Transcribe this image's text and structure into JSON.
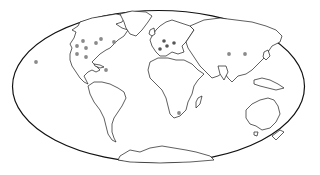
{
  "map": {
    "projection": "mollweide",
    "frame": {
      "cx": 158.5,
      "cy": 86.5,
      "rx": 146,
      "ry": 76
    },
    "marker_color": "#8a8a8a",
    "marker_dark_color": "#555555",
    "markers": [
      {
        "region": "north-america",
        "x": 83,
        "y": 41
      },
      {
        "region": "north-america",
        "x": 101,
        "y": 39
      },
      {
        "region": "north-america",
        "x": 77,
        "y": 46
      },
      {
        "region": "north-america",
        "x": 86,
        "y": 48
      },
      {
        "region": "north-america",
        "x": 96,
        "y": 43
      },
      {
        "region": "north-america",
        "x": 77,
        "y": 54
      },
      {
        "region": "north-america",
        "x": 86,
        "y": 57
      },
      {
        "region": "north-america",
        "x": 106,
        "y": 70
      },
      {
        "region": "north-america",
        "x": 114,
        "y": 42
      },
      {
        "region": "pacific-hawaii",
        "x": 36,
        "y": 62
      },
      {
        "region": "europe",
        "x": 164,
        "y": 41
      },
      {
        "region": "europe",
        "x": 167,
        "y": 46
      },
      {
        "region": "europe",
        "x": 160,
        "y": 49
      },
      {
        "region": "europe",
        "x": 174,
        "y": 43
      },
      {
        "region": "asia",
        "x": 229,
        "y": 54
      },
      {
        "region": "asia",
        "x": 245,
        "y": 54
      },
      {
        "region": "southern-africa",
        "x": 179,
        "y": 113
      }
    ]
  }
}
